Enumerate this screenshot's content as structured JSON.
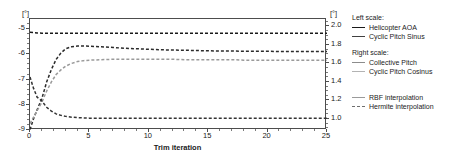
{
  "axes": {
    "left_unit": "[°]",
    "right_unit": "[°]",
    "xlabel": "Trim iteration",
    "yticks_left": [
      "-5",
      "-6",
      "-7",
      "-8",
      "-9"
    ],
    "yticks_right": [
      "2.0",
      "1.8",
      "1.6",
      "1.4",
      "1.2",
      "1.0"
    ],
    "xticks": [
      "0",
      "5",
      "10",
      "15",
      "20",
      "25"
    ]
  },
  "legend": {
    "groups": [
      {
        "heading": "Left scale:",
        "items": [
          {
            "label": "Helicopter AOA",
            "color": "#1a1a1a",
            "style": "solid"
          },
          {
            "label": "Cyclic Pitch Sinus",
            "color": "#404040",
            "style": "solid"
          }
        ]
      },
      {
        "heading": "Right scale:",
        "items": [
          {
            "label": "Collective Pitch",
            "color": "#8c8c8c",
            "style": "solid"
          },
          {
            "label": "Cyclic Pitch Cosinus",
            "color": "#b3b3b3",
            "style": "solid"
          }
        ]
      },
      {
        "heading": "",
        "items": [
          {
            "label": "RBF interpolation",
            "color": "#9a9a9a",
            "style": "solid"
          },
          {
            "label": "Hermite interpolation",
            "color": "#6e6e6e",
            "style": "dashed"
          }
        ]
      }
    ]
  },
  "chart_data": {
    "type": "line",
    "title": "",
    "xlabel": "Trim iteration",
    "ylabel": "[°]",
    "y2label": "[°]",
    "xlim": [
      0,
      25
    ],
    "ylim": [
      -9,
      -4.6
    ],
    "y2lim": [
      0.88,
      2.08
    ],
    "grid": false,
    "legend_position": "right",
    "x": [
      0,
      0.3,
      0.6,
      1,
      1.4,
      1.8,
      2.2,
      2.6,
      3,
      3.5,
      4,
      4.5,
      5,
      6,
      7,
      8,
      9,
      10,
      11,
      12,
      13,
      14,
      15,
      16,
      17,
      18,
      19,
      20,
      21,
      22,
      23,
      24,
      25
    ],
    "series": [
      {
        "name": "Helicopter AOA",
        "axis": "left",
        "color": "#1a1a1a",
        "style": "dashed",
        "values": [
          -5.13,
          -5.14,
          -5.15,
          -5.16,
          -5.16,
          -5.16,
          -5.16,
          -5.16,
          -5.16,
          -5.16,
          -5.16,
          -5.16,
          -5.16,
          -5.16,
          -5.16,
          -5.16,
          -5.16,
          -5.16,
          -5.16,
          -5.16,
          -5.16,
          -5.16,
          -5.16,
          -5.16,
          -5.16,
          -5.16,
          -5.16,
          -5.16,
          -5.16,
          -5.16,
          -5.16,
          -5.16,
          -5.16
        ]
      },
      {
        "name": "Cyclic Pitch Sinus",
        "axis": "left",
        "color": "#2b2b2b",
        "style": "dashed",
        "values": [
          -8.98,
          -8.55,
          -8.2,
          -7.75,
          -7.1,
          -6.6,
          -6.2,
          -5.95,
          -5.78,
          -5.7,
          -5.67,
          -5.67,
          -5.68,
          -5.7,
          -5.73,
          -5.76,
          -5.78,
          -5.8,
          -5.82,
          -5.83,
          -5.84,
          -5.85,
          -5.86,
          -5.87,
          -5.87,
          -5.88,
          -5.88,
          -5.88,
          -5.89,
          -5.89,
          -5.89,
          -5.89,
          -5.89
        ]
      },
      {
        "name": "Collective Pitch",
        "axis": "right",
        "color": "#9a9a9a",
        "style": "dashed",
        "values": [
          0.95,
          1.02,
          1.09,
          1.18,
          1.3,
          1.4,
          1.48,
          1.53,
          1.57,
          1.6,
          1.62,
          1.63,
          1.635,
          1.64,
          1.645,
          1.645,
          1.645,
          1.645,
          1.645,
          1.645,
          1.64,
          1.64,
          1.64,
          1.64,
          1.64,
          1.635,
          1.635,
          1.635,
          1.635,
          1.635,
          1.635,
          1.635,
          1.635
        ]
      },
      {
        "name": "Cyclic Pitch Cosinus",
        "axis": "left",
        "color": "#333333",
        "style": "dashed",
        "values": [
          -6.9,
          -7.35,
          -7.7,
          -7.85,
          -8.1,
          -8.25,
          -8.36,
          -8.42,
          -8.46,
          -8.49,
          -8.51,
          -8.52,
          -8.53,
          -8.53,
          -8.53,
          -8.53,
          -8.53,
          -8.53,
          -8.53,
          -8.53,
          -8.53,
          -8.53,
          -8.53,
          -8.53,
          -8.53,
          -8.53,
          -8.53,
          -8.53,
          -8.53,
          -8.53,
          -8.53,
          -8.53,
          -8.53
        ]
      }
    ]
  }
}
